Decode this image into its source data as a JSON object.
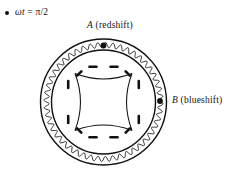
{
  "figure": {
    "phase_label": {
      "bullet": "filled-circle",
      "text": "ωt = π/2",
      "symbol_omega_t": "ωt",
      "equals": "=",
      "value": "π/2"
    },
    "points": [
      {
        "id": "A",
        "letter": "A",
        "annotation": "(redshift)",
        "full_label": "A (redshift)",
        "position_deg": 90
      },
      {
        "id": "B",
        "letter": "B",
        "annotation": "(blueshift)",
        "full_label": "B (blueshift)",
        "position_deg": 0
      }
    ],
    "geometry": {
      "center_x": 103.5,
      "center_y": 102,
      "outer_radius": 63,
      "wavy_radius": 57,
      "inner_radius": 52,
      "wave_amplitude": 2.6,
      "wave_cycles": 48,
      "astroid_radius": 36,
      "arrow_count": 8
    },
    "colors": {
      "stroke": "#111111",
      "background": "#ffffff",
      "dot": "#111111"
    }
  }
}
